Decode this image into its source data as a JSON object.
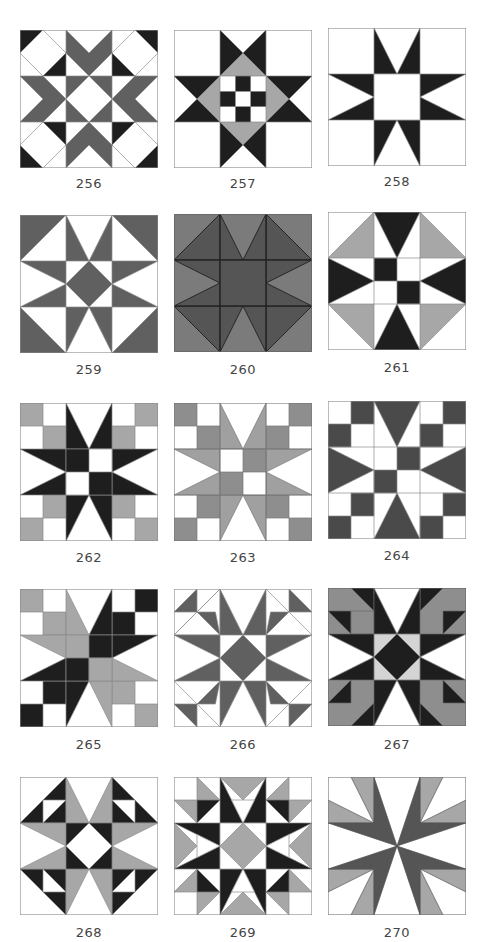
{
  "colors": {
    "white": "#ffffff",
    "black": "#1e1e1e",
    "dark": "#606060",
    "mid": "#a7a7a7",
    "light": "#d4d4d4",
    "line": "#8a8a8a"
  },
  "blocks": [
    {
      "id": "256",
      "label": "256"
    },
    {
      "id": "257",
      "label": "257"
    },
    {
      "id": "258",
      "label": "258"
    },
    {
      "id": "259",
      "label": "259"
    },
    {
      "id": "260",
      "label": "260"
    },
    {
      "id": "261",
      "label": "261"
    },
    {
      "id": "262",
      "label": "262"
    },
    {
      "id": "263",
      "label": "263"
    },
    {
      "id": "264",
      "label": "264"
    },
    {
      "id": "265",
      "label": "265"
    },
    {
      "id": "266",
      "label": "266"
    },
    {
      "id": "267",
      "label": "267"
    },
    {
      "id": "268",
      "label": "268"
    },
    {
      "id": "269",
      "label": "269"
    },
    {
      "id": "270",
      "label": "270"
    }
  ]
}
